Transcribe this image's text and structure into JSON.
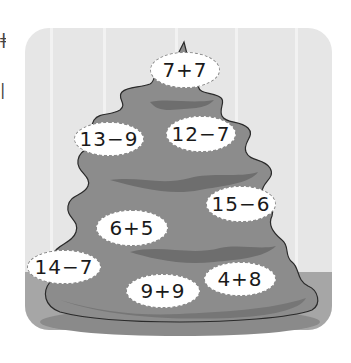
{
  "left_edge_glyphs": [
    "ǂ",
    "|"
  ],
  "scene": {
    "description": "Christmas tree worksheet with arithmetic expressions",
    "colors": {
      "wall": "#e6e6e6",
      "floor": "#a6a6a6",
      "tree": "#8c8c8c",
      "tree_shadow": "#6e6e6e",
      "bubble": "#ffffff"
    }
  },
  "bubbles": [
    {
      "expr": "7+7",
      "x": 150,
      "y": 52,
      "w": 70,
      "h": 36
    },
    {
      "expr": "13−9",
      "x": 74,
      "y": 122,
      "w": 70,
      "h": 34
    },
    {
      "expr": "12−7",
      "x": 166,
      "y": 116,
      "w": 70,
      "h": 36
    },
    {
      "expr": "15−6",
      "x": 206,
      "y": 186,
      "w": 70,
      "h": 36
    },
    {
      "expr": "6+5",
      "x": 96,
      "y": 210,
      "w": 72,
      "h": 36
    },
    {
      "expr": "14−7",
      "x": 27,
      "y": 250,
      "w": 74,
      "h": 34
    },
    {
      "expr": "9+9",
      "x": 126,
      "y": 274,
      "w": 74,
      "h": 34
    },
    {
      "expr": "4+8",
      "x": 204,
      "y": 262,
      "w": 72,
      "h": 34
    }
  ]
}
